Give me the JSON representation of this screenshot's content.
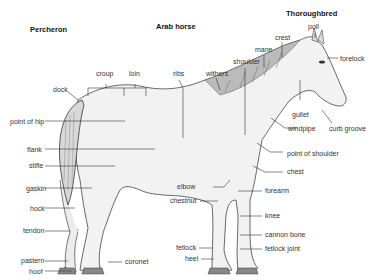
{
  "breeds": {
    "percheron": "Percheron",
    "arab": "Arab horse",
    "thoroughbred": "Thoroughbred"
  },
  "labels": {
    "croup": "croup",
    "loin": "loin",
    "ribs": "ribs",
    "withers": "withers",
    "shoulder": "shoulder",
    "mane": "mane",
    "crest": "crest",
    "poll": "poll",
    "forelock": "forelock",
    "dock": "dock",
    "point_of_hip": "point of hip",
    "flank": "flank",
    "stifle": "stifle",
    "gaskin": "gaskin",
    "hock": "hock",
    "tendon": "tendon",
    "pastern": "pastern",
    "hoof": "hoof",
    "coronet": "coronet",
    "gullet": "gullet",
    "windpipe": "windpipe",
    "curb_groove": "curb groove",
    "point_of_shoulder": "point of shoulder",
    "chest": "chest",
    "elbow": "elbow",
    "chestnut": "chestnut",
    "forearm": "forearm",
    "knee": "knee",
    "cannon_bone": "cannon bone",
    "fetlock": "fetlock",
    "fetlock_joint": "fetlock joint",
    "heel": "heel"
  }
}
